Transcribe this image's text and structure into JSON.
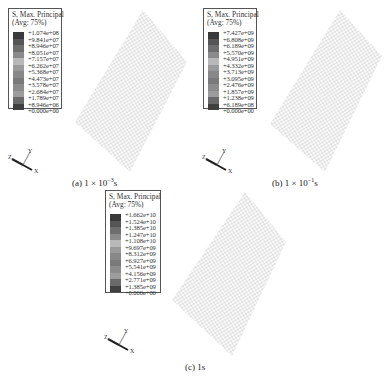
{
  "figure": {
    "panels": [
      {
        "id": "a",
        "caption_prefix": "(a) 1 × 10",
        "caption_exp": "−3",
        "caption_suffix": "s",
        "legend": {
          "title_line1": "S, Max. Principal",
          "title_line2": "(Avg: 75%)",
          "values": [
            "+1.074e+08",
            "+9.841e+07",
            "+8.946e+07",
            "+8.051e+07",
            "+7.157e+07",
            "+6.262e+07",
            "+5.368e+07",
            "+4.473e+07",
            "+3.578e+07",
            "+2.684e+07",
            "+1.789e+07",
            "+8.946e+06",
            "+0.000e+00"
          ]
        },
        "triad": {
          "x": "X",
          "y": "Y",
          "z": "Z"
        }
      },
      {
        "id": "b",
        "caption_prefix": "(b) 1 × 10",
        "caption_exp": "−1",
        "caption_suffix": "s",
        "legend": {
          "title_line1": "S, Max. Principal",
          "title_line2": "(Avg: 75%)",
          "values": [
            "+7.427e+09",
            "+6.808e+09",
            "+6.189e+09",
            "+5.570e+09",
            "+4.951e+09",
            "+4.332e+09",
            "+3.713e+09",
            "+3.095e+09",
            "+2.476e+09",
            "+1.857e+09",
            "+1.238e+09",
            "+6.189e+08",
            "+0.000e+00"
          ]
        },
        "triad": {
          "x": "X",
          "y": "Y",
          "z": "Z"
        }
      },
      {
        "id": "c",
        "caption_prefix": "(c) 1s",
        "caption_exp": "",
        "caption_suffix": "",
        "legend": {
          "title_line1": "S, Max. Principal",
          "title_line2": "(Avg: 75%)",
          "values": [
            "+1.662e+10",
            "+1.524e+10",
            "+1.385e+10",
            "+1.247e+10",
            "+1.108e+10",
            "+9.697e+09",
            "+8.312e+09",
            "+6.927e+09",
            "+5.541e+09",
            "+4.156e+09",
            "+2.771e+09",
            "+1.385e+09",
            "+0.000e+00"
          ]
        },
        "triad": {
          "x": "X",
          "y": "Y",
          "z": "Z"
        }
      }
    ],
    "swatch_colors": [
      "#3a3a3a",
      "#555555",
      "#6e6e6e",
      "#8a8a8a",
      "#b8b8b8",
      "#9a9a9a",
      "#888888",
      "#7a7a7a",
      "#8c8c8c",
      "#9c9c9c",
      "#6a6a6a",
      "#404040"
    ],
    "mesh_color": "#9a9a9a"
  }
}
